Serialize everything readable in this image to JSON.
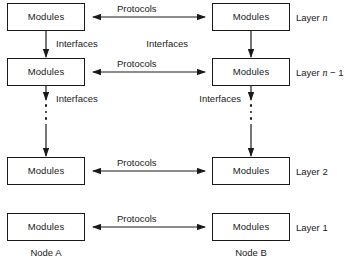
{
  "diagram": {
    "box_label": "Modules",
    "protocol_label": "Protocols",
    "interface_label": "Interfaces",
    "colors": {
      "stroke": "#1a1a1a",
      "background": "#ffffff",
      "text": "#1a1a1a"
    },
    "layers": [
      {
        "id": "layer-n",
        "label_prefix": "Layer",
        "label_var": "n",
        "label_suffix": "",
        "left_box": "Modules",
        "right_box": "Modules",
        "protocol": "Protocols",
        "interface_below": "Interfaces"
      },
      {
        "id": "layer-n-minus-1",
        "label_prefix": "Layer",
        "label_var": "n",
        "label_suffix": " − 1",
        "left_box": "Modules",
        "right_box": "Modules",
        "protocol": "Protocols",
        "interface_below": "Interfaces"
      },
      {
        "id": "layer-2",
        "label_prefix": "Layer",
        "label_var": "",
        "label_suffix": "2",
        "left_box": "Modules",
        "right_box": "Modules",
        "protocol": "Protocols",
        "interface_below": ""
      },
      {
        "id": "layer-1",
        "label_prefix": "Layer",
        "label_var": "",
        "label_suffix": "1",
        "left_box": "Modules",
        "right_box": "Modules",
        "protocol": "Protocols",
        "interface_below": ""
      }
    ],
    "nodes": {
      "left": "Node A",
      "right": "Node B"
    },
    "ellipsis": {
      "dot_count": 3,
      "meaning": "intermediate layers omitted"
    }
  }
}
